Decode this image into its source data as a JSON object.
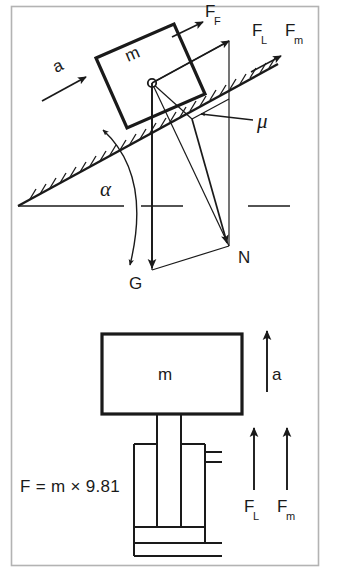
{
  "figure": {
    "border_color": "#b0b0b0",
    "ink_color": "#1a1a1a",
    "background": "#ffffff"
  },
  "top_diagram": {
    "name": "inclined-plane-force-diagram",
    "mass_label": "m",
    "labels": {
      "acceleration": "a",
      "friction_force": "F",
      "friction_force_sub": "F",
      "load_force": "F",
      "load_force_sub": "L",
      "motor_force": "F",
      "motor_force_sub": "m",
      "friction_coefficient": "μ",
      "incline_angle": "α",
      "weight": "G",
      "normal_force": "N"
    },
    "vectors": [
      {
        "name": "a",
        "label": "a",
        "direction": "up-slope",
        "origin": "left of block"
      },
      {
        "name": "F_F",
        "label": "F_F",
        "direction": "up-slope",
        "origin": "top edge of block"
      },
      {
        "name": "F_L",
        "label": "F_L",
        "direction": "up-slope",
        "origin": "center of mass"
      },
      {
        "name": "F_m",
        "label": "F_m",
        "direction": "up-slope",
        "origin": "on incline surface"
      },
      {
        "name": "G",
        "label": "G",
        "direction": "straight down",
        "origin": "center of mass"
      },
      {
        "name": "N",
        "label": "N",
        "direction": "perpendicular into incline",
        "origin": "center of mass"
      }
    ],
    "surface": "hatched inclined plane",
    "reference_line": "horizontal dashed datum"
  },
  "bottom_diagram": {
    "name": "hydraulic-cylinder-free-body-diagram",
    "mass_label": "m",
    "force_equation": "F = m × 9.81",
    "labels": {
      "acceleration": "a",
      "load_force": "F",
      "load_force_sub": "L",
      "motor_force": "F",
      "motor_force_sub": "m"
    },
    "vectors": [
      {
        "name": "a",
        "label": "a",
        "direction": "up"
      },
      {
        "name": "F_L",
        "label": "F_L",
        "direction": "up"
      },
      {
        "name": "F_m",
        "label": "F_m",
        "direction": "up"
      }
    ],
    "components": [
      "mass block",
      "piston rod",
      "cylinder body",
      "cylinder ports",
      "base plate"
    ]
  }
}
